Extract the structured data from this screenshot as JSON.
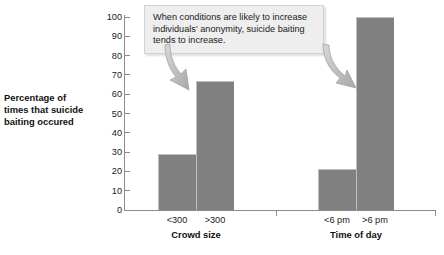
{
  "chart_data": {
    "type": "bar",
    "title": "",
    "xlabel": "",
    "ylabel": "Percentage of times that suicide baiting occured",
    "ylim": [
      0,
      100
    ],
    "ytick_labels": [
      "100",
      "90",
      "80",
      "70",
      "60",
      "50",
      "40",
      "30",
      "20",
      "10",
      "0"
    ],
    "ytick_values": [
      100,
      90,
      80,
      70,
      60,
      50,
      40,
      30,
      20,
      10,
      0
    ],
    "grid": false,
    "legend": "none",
    "bar_color": "#808080",
    "categories": [
      "<300",
      ">300",
      "<6 pm",
      ">6 pm"
    ],
    "values": [
      29,
      67,
      21,
      100
    ],
    "groups": [
      {
        "label": "Crowd size",
        "categories": [
          "<300",
          ">300"
        ],
        "values": [
          29,
          67
        ]
      },
      {
        "label": "Time of day",
        "categories": [
          "<6 pm",
          ">6 pm"
        ],
        "values": [
          21,
          100
        ]
      }
    ],
    "annotations": [
      {
        "text": "When conditions are likely to increase individuals' anonymity, suicide baiting tends to increase.",
        "points_to": [
          ">300",
          ">6 pm"
        ]
      }
    ]
  },
  "axis": {
    "y_title_line1": "Percentage of",
    "y_title_line2": "times that suicide",
    "y_title_line3": "baiting occured"
  },
  "colors": {
    "bar": "#808080",
    "bar_highlight": "#bfbfbf",
    "axis": "#8c8c8c",
    "callout_bg": "#eeeeee",
    "callout_border": "#d2d2d2",
    "arrow": "#b5b5b5"
  }
}
